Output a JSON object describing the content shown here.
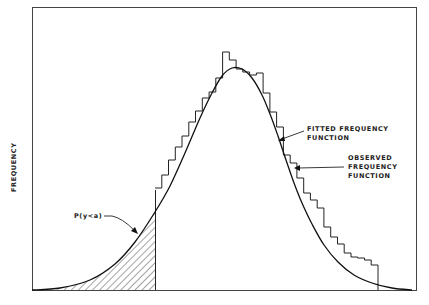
{
  "chart_data": {
    "type": "area",
    "title": "",
    "xlabel": "",
    "ylabel": "FREQUENCY",
    "grid": false,
    "legend": null,
    "series": [
      {
        "name": "FITTED FREQUENCY FUNCTION",
        "kind": "smooth curve (skewed bell shape)",
        "peak_x_fraction": 0.52,
        "points_px": [
          [
            32,
            290
          ],
          [
            60,
            288
          ],
          [
            90,
            280
          ],
          [
            115,
            264
          ],
          [
            135,
            242
          ],
          [
            155,
            212
          ],
          [
            170,
            186
          ],
          [
            185,
            153
          ],
          [
            200,
            118
          ],
          [
            212,
            93
          ],
          [
            222,
            76
          ],
          [
            232,
            68
          ],
          [
            242,
            69
          ],
          [
            252,
            78
          ],
          [
            262,
            95
          ],
          [
            270,
            114
          ],
          [
            278,
            136
          ],
          [
            286,
            160
          ],
          [
            294,
            183
          ],
          [
            302,
            203
          ],
          [
            312,
            224
          ],
          [
            324,
            245
          ],
          [
            338,
            262
          ],
          [
            354,
            275
          ],
          [
            372,
            283
          ],
          [
            392,
            288
          ],
          [
            412,
            290
          ]
        ]
      },
      {
        "name": "OBSERVED FREQUENCY FUNCTION",
        "kind": "step histogram",
        "x_start_px": 155,
        "x_end_px": 378,
        "bin_width_px": 8.2,
        "bar_tops_px": [
          188,
          175,
          160,
          147,
          136,
          122,
          111,
          98,
          92,
          78,
          52,
          60,
          69,
          72,
          75,
          73,
          93,
          112,
          127,
          155,
          163,
          178,
          193,
          200,
          208,
          227,
          237,
          244,
          253,
          257,
          258,
          260,
          265
        ]
      }
    ],
    "annotations": [
      {
        "text": "FITTED FREQUENCY FUNCTION",
        "points_to": "fitted curve"
      },
      {
        "text": "OBSERVED FREQUENCY FUNCTION",
        "points_to": "histogram step"
      },
      {
        "text": "P(y<a)",
        "points_to": "hatched left tail area"
      }
    ],
    "shaded_region": {
      "description": "hatched area under fitted curve left of x=a",
      "x_from_px": 32,
      "x_to_px": 155
    }
  },
  "labels": {
    "y_axis": "FREQUENCY",
    "fitted_line1": "FITTED  FREQUENCY",
    "fitted_line2": "FUNCTION",
    "observed_line1": "OBSERVED",
    "observed_line2": "FREQUENCY",
    "observed_line3": "FUNCTION",
    "tail_prob": "P(y<a)"
  }
}
